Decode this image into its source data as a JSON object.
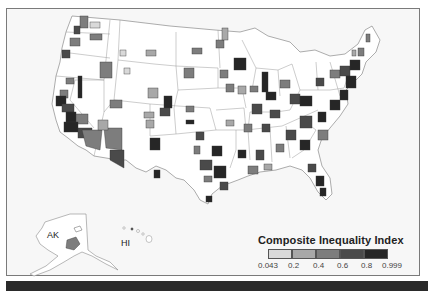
{
  "map": {
    "type": "choropleth",
    "region": "United States metropolitan areas",
    "labels": {
      "alaska": "AK",
      "hawaii": "HI"
    },
    "background_color": "#f7f7f7",
    "land_color": "#ffffff",
    "border_color": "#7a7a7a"
  },
  "legend": {
    "title": "Composite Inequality Index",
    "ticks": [
      "0.043",
      "0.2",
      "0.4",
      "0.6",
      "0.8",
      "0.999"
    ],
    "classes": [
      {
        "range": "0.043–0.2",
        "color": "#d9d9d9"
      },
      {
        "range": "0.2–0.4",
        "color": "#a8a8a8"
      },
      {
        "range": "0.4–0.6",
        "color": "#7d7d7d"
      },
      {
        "range": "0.6–0.8",
        "color": "#4a4a4a"
      },
      {
        "range": "0.8–0.999",
        "color": "#262626"
      }
    ]
  }
}
